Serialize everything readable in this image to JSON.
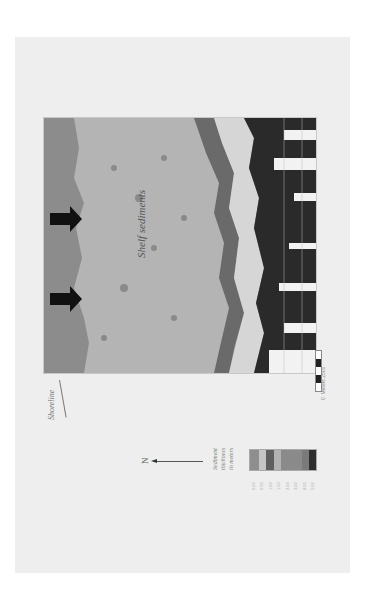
{
  "figure": {
    "map_label": "Shelf sediments",
    "shoreline_label": "Shoreline",
    "north_label": "N",
    "legend": {
      "title_lines": [
        "Sediment",
        "thickness",
        "in meters"
      ],
      "colors": [
        "#8e8e8e",
        "#c4c4c4",
        "#5e5e5e",
        "#b2b2b2",
        "#8a8a8a",
        "#8a8a8a",
        "#7a7a7a",
        "#2e2e2e"
      ],
      "values": [
        "0.00",
        "0.50",
        "1.00",
        "1.50",
        "2.00",
        "3.00",
        "4.00",
        "5.00"
      ]
    },
    "scale_bar": {
      "start": "0",
      "unit": "Meters",
      "end": "2500"
    },
    "arrows": [
      "flow-arrow-1",
      "flow-arrow-2"
    ]
  }
}
